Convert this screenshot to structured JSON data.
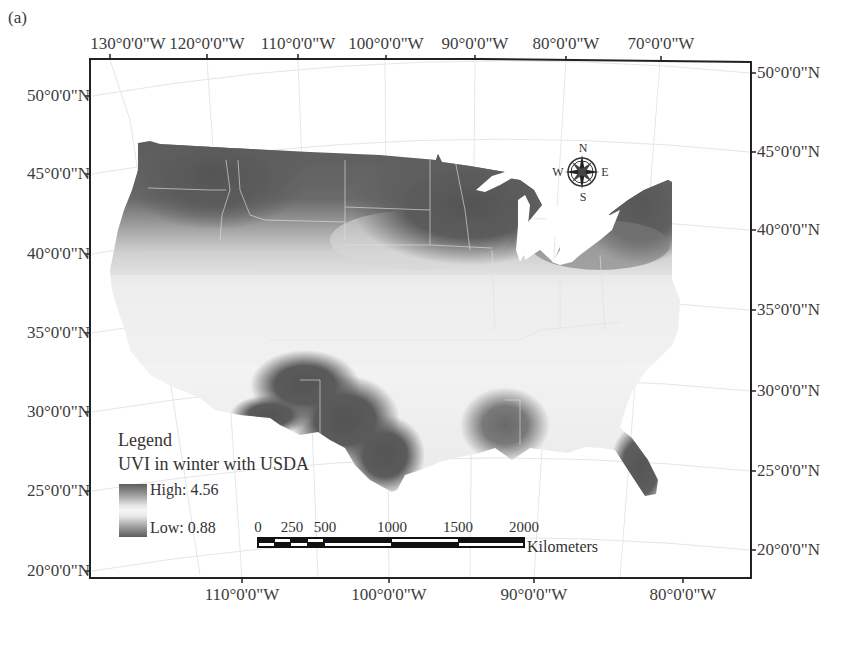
{
  "figure": {
    "panel_label": "(a)",
    "title": "UVI in winter with USDA"
  },
  "axes": {
    "top_longitudes": [
      {
        "label": "130°0'0\"W",
        "x": 128
      },
      {
        "label": "120°0'0\"W",
        "x": 207
      },
      {
        "label": "110°0'0\"W",
        "x": 298
      },
      {
        "label": "100°0'0\"W",
        "x": 385
      },
      {
        "label": "90°0'0\"W",
        "x": 475
      },
      {
        "label": "80°0'0\"W",
        "x": 566
      },
      {
        "label": "70°0'0\"W",
        "x": 660
      }
    ],
    "bottom_longitudes": [
      {
        "label": "110°0'0\"W",
        "x": 242
      },
      {
        "label": "100°0'0\"W",
        "x": 389
      },
      {
        "label": "90°0'0\"W",
        "x": 534
      },
      {
        "label": "80°0'0\"W",
        "x": 683
      }
    ],
    "left_latitudes": [
      {
        "label": "50°0'0\"N",
        "y": 96
      },
      {
        "label": "45°0'0\"N",
        "y": 174
      },
      {
        "label": "40°0'0\"N",
        "y": 254
      },
      {
        "label": "35°0'0\"N",
        "y": 333
      },
      {
        "label": "30°0'0\"N",
        "y": 412
      },
      {
        "label": "25°0'0\"N",
        "y": 491
      },
      {
        "label": "20°0'0\"N",
        "y": 571
      }
    ],
    "right_latitudes": [
      {
        "label": "50°0'0\"N",
        "y": 73
      },
      {
        "label": "45°0'0\"N",
        "y": 152
      },
      {
        "label": "40°0'0\"N",
        "y": 230
      },
      {
        "label": "35°0'0\"N",
        "y": 310
      },
      {
        "label": "30°0'0\"N",
        "y": 391
      },
      {
        "label": "25°0'0\"N",
        "y": 471
      },
      {
        "label": "20°0'0\"N",
        "y": 550
      }
    ]
  },
  "legend": {
    "heading": "Legend",
    "layer": "UVI in winter with USDA",
    "high_label": "High: 4.56",
    "low_label": "Low: 0.88",
    "high_value": 4.56,
    "low_value": 0.88,
    "high_color": "#5e5e5e",
    "low_color": "#5e5e5e",
    "mid_color": "#f6f6f6"
  },
  "scale_bar": {
    "ticks": [
      {
        "label": "0",
        "x": 258
      },
      {
        "label": "250",
        "x": 292
      },
      {
        "label": "500",
        "x": 325
      },
      {
        "label": "1000",
        "x": 392
      },
      {
        "label": "1500",
        "x": 458
      },
      {
        "label": "2000",
        "x": 524
      }
    ],
    "unit": "Kilometers"
  },
  "compass": {
    "n": "N",
    "s": "S",
    "e": "E",
    "w": "W"
  },
  "colors": {
    "high_uvi": "#5a5a5a",
    "low_uvi": "#f2f2f2",
    "frame": "#222222"
  }
}
